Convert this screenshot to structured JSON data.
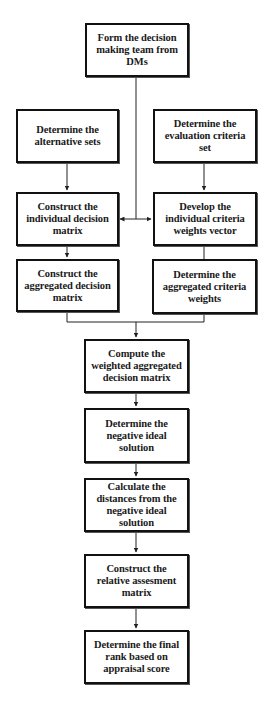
{
  "diagram": {
    "type": "flowchart",
    "colors": {
      "background": "#ffffff",
      "box_border": "#111111",
      "text": "#1a1a1a",
      "connector": "#222222"
    },
    "nodes": {
      "form_team": "Form the decision making team from DMs",
      "alternative_sets": "Determine the alternative sets",
      "evaluation_criteria": "Determine the evaluation criteria set",
      "individual_matrix": "Construct the individual decision matrix",
      "individual_weights": "Develop the individual criteria weights vector",
      "aggregated_matrix": "Construct the aggregated decision matrix",
      "aggregated_weights": "Determine the aggregated criteria weights",
      "weighted_matrix": "Compute the weighted aggregated decision matrix",
      "negative_ideal": "Determine the negative ideal solution",
      "distances": "Calculate the distances from the negative ideal solution",
      "relative_matrix": "Construct the relative assesment matrix",
      "final_rank": "Determine the final rank based on appraisal score"
    },
    "edges": [
      {
        "from": "form_team",
        "to": "individual_matrix",
        "style": "line-to-double-arrow"
      },
      {
        "from": "form_team",
        "to": "individual_weights",
        "style": "line-to-double-arrow"
      },
      {
        "from": "alternative_sets",
        "to": "individual_matrix",
        "style": "arrow"
      },
      {
        "from": "evaluation_criteria",
        "to": "individual_weights",
        "style": "arrow"
      },
      {
        "from": "individual_matrix",
        "to": "aggregated_matrix",
        "style": "arrow"
      },
      {
        "from": "individual_weights",
        "to": "aggregated_weights",
        "style": "line"
      },
      {
        "from": "aggregated_matrix",
        "to": "weighted_matrix",
        "style": "merge-arrow"
      },
      {
        "from": "aggregated_weights",
        "to": "weighted_matrix",
        "style": "merge-arrow"
      },
      {
        "from": "weighted_matrix",
        "to": "negative_ideal",
        "style": "arrow"
      },
      {
        "from": "negative_ideal",
        "to": "distances",
        "style": "arrow"
      },
      {
        "from": "distances",
        "to": "relative_matrix",
        "style": "arrow"
      },
      {
        "from": "relative_matrix",
        "to": "final_rank",
        "style": "arrow"
      }
    ]
  }
}
